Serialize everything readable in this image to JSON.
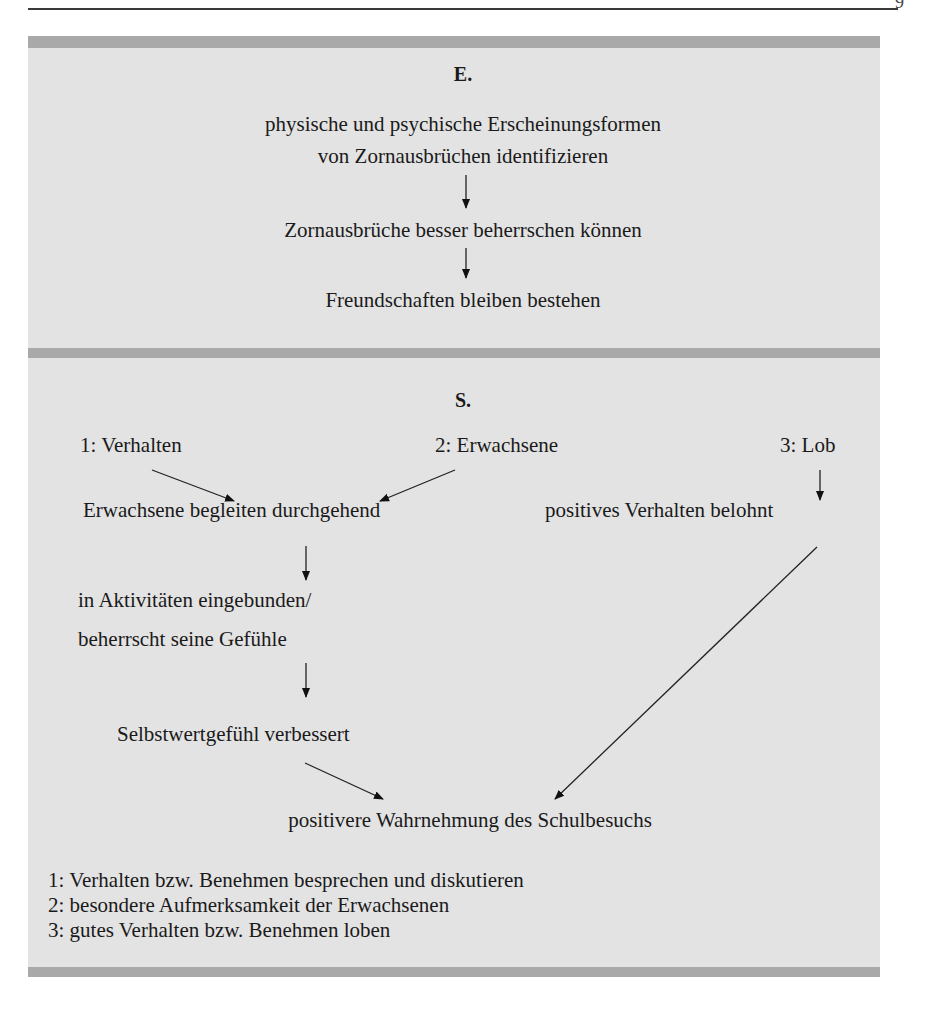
{
  "page": {
    "header_mark": "9"
  },
  "section_e": {
    "title": "E.",
    "nodes": [
      "physische und psychische Erscheinungsformen",
      "von Zornausbrüchen identifizieren",
      "Zornausbrüche besser beherrschen können",
      "Freundschaften bleiben bestehen"
    ]
  },
  "section_s": {
    "title": "S.",
    "sources": {
      "s1": "1: Verhalten",
      "s2": "2: Erwachsene",
      "s3": "3: Lob"
    },
    "nodes": {
      "accompany": "Erwachsene begleiten durchgehend",
      "reward": "positives Verhalten belohnt",
      "activities_line1": "in Aktivitäten eingebunden/",
      "activities_line2": "beherrscht seine Gefühle",
      "selfesteem": "Selbstwertgefühl verbessert",
      "outcome": "positivere Wahrnehmung des Schulbesuchs"
    },
    "legend": [
      "1: Verhalten bzw. Benehmen besprechen und diskutieren",
      "2: besondere Aufmerksamkeit der Erwachsenen",
      "3: gutes Verhalten bzw. Benehmen loben"
    ]
  },
  "colors": {
    "box_fill": "#e3e3e3",
    "band_fill": "#a9a9a9",
    "text": "#1a1a1a"
  }
}
